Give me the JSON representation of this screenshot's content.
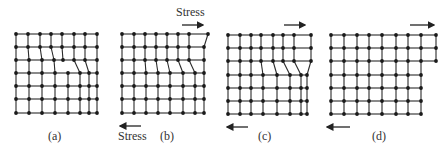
{
  "figure": {
    "stress_label": "Stress",
    "panels": [
      {
        "id": "a",
        "label": "(a)"
      },
      {
        "id": "b",
        "label": "(b)"
      },
      {
        "id": "c",
        "label": "(c)"
      },
      {
        "id": "d",
        "label": "(d)"
      }
    ],
    "colors": {
      "lattice": "#2a2a2a",
      "atom": "#1a1a1a",
      "text": "#333333"
    }
  }
}
